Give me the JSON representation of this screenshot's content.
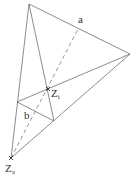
{
  "diagram": {
    "type": "geometric-construction",
    "stroke_color": "#6e6e6e",
    "points": {
      "top": [
        29,
        4
      ],
      "right": [
        130,
        54
      ],
      "left_mid": [
        17,
        102
      ],
      "bottom_mid": [
        54,
        121
      ],
      "Zi": [
        48,
        89
      ],
      "Za": [
        11,
        158
      ],
      "a_foot": [
        78,
        29
      ]
    },
    "labels": {
      "a": {
        "text": "a"
      },
      "b": {
        "text": "b"
      },
      "Zi": {
        "main": "Z",
        "sub": "i"
      },
      "Za": {
        "main": "Z",
        "sub": "a"
      }
    }
  }
}
